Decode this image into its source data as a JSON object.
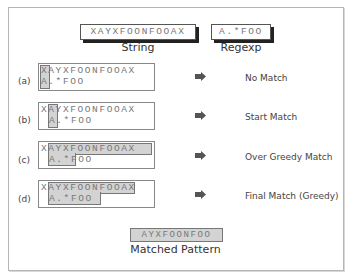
{
  "header": {
    "string_value": "XAYXFOONFOOAX",
    "string_caption": "String",
    "regexp_value": "A.*FOO",
    "regexp_caption": "Regexp"
  },
  "cases": [
    {
      "label": "(a)",
      "string": "XAYXFOONFOOAX",
      "pattern": "A.*FOO",
      "pattern_indent": 0,
      "result": "No Match"
    },
    {
      "label": "(b)",
      "string": "XAYXFOONFOOAX",
      "pattern": "A.*FOO",
      "pattern_indent": 1,
      "result": "Start Match"
    },
    {
      "label": "(c)",
      "string": "XAYXFOONFOOAX",
      "pattern": "A.*FOO",
      "pattern_indent": 1,
      "result": "Over Greedy Match"
    },
    {
      "label": "(d)",
      "string": "XAYXFOONFOOAX",
      "pattern": "A.*FOO",
      "pattern_indent": 1,
      "result": "Final Match (Greedy)"
    }
  ],
  "footer": {
    "matched_value": "AYXFOONFOO",
    "matched_caption": "Matched Pattern"
  },
  "colors": {
    "highlight": "#d3d3d3",
    "arrow": "#555555",
    "border": "#777777"
  }
}
